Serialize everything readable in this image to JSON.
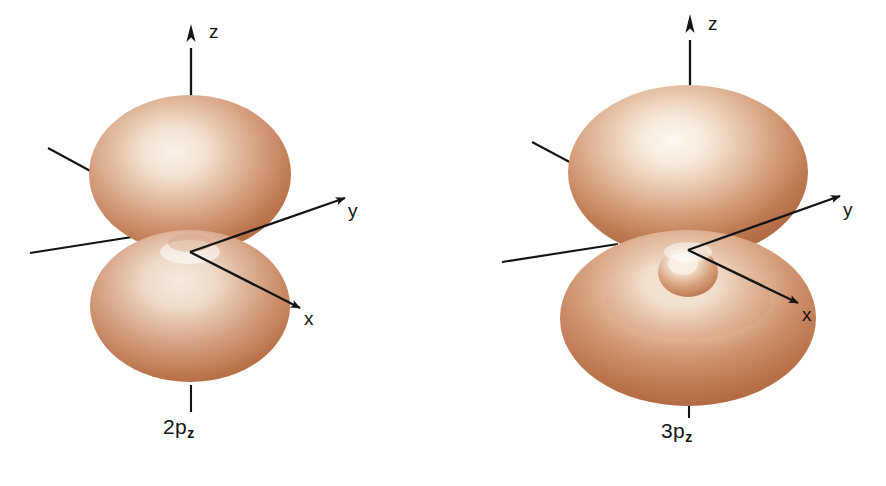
{
  "figure": {
    "background_color": "#ffffff",
    "title": ""
  },
  "palette": {
    "lobe_edge": "#b4683f",
    "lobe_mid": "#cf9573",
    "lobe_highlight": "#f8efe4",
    "lobe_shadow": "#a85c36",
    "axis_line": "#141414",
    "text": "#141414",
    "background": "#ffffff"
  },
  "orbitals": [
    {
      "id": "2pz",
      "caption_main": "2p",
      "caption_sub": "z",
      "caption_full": "2p_z",
      "shape": "two-lobe dumbbell",
      "lobes": 2,
      "radial_nodes": 0,
      "inner_lobe_visible": false,
      "axes": [
        {
          "name": "z",
          "label": "z",
          "direction": "up",
          "arrow": true
        },
        {
          "name": "y",
          "label": "y",
          "direction": "right-slightly-up",
          "arrow": true
        },
        {
          "name": "x",
          "label": "x",
          "direction": "down-right-toward-viewer",
          "arrow": true
        }
      ]
    },
    {
      "id": "3pz",
      "caption_main": "3p",
      "caption_sub": "z",
      "caption_full": "3p_z",
      "shape": "two large flattened lobes with small inner lobes at the nucleus",
      "lobes": 2,
      "radial_nodes": 1,
      "inner_lobe_visible": true,
      "axes": [
        {
          "name": "z",
          "label": "z",
          "direction": "up",
          "arrow": true
        },
        {
          "name": "y",
          "label": "y",
          "direction": "right-slightly-up",
          "arrow": true
        },
        {
          "name": "x",
          "label": "x",
          "direction": "down-right-toward-viewer",
          "arrow": true
        }
      ]
    }
  ],
  "labels": {
    "left": {
      "z": "z",
      "y": "y",
      "x": "x",
      "caption_main": "2p",
      "caption_sub": "z"
    },
    "right": {
      "z": "z",
      "y": "y",
      "x": "x",
      "caption_main": "3p",
      "caption_sub": "z"
    }
  }
}
